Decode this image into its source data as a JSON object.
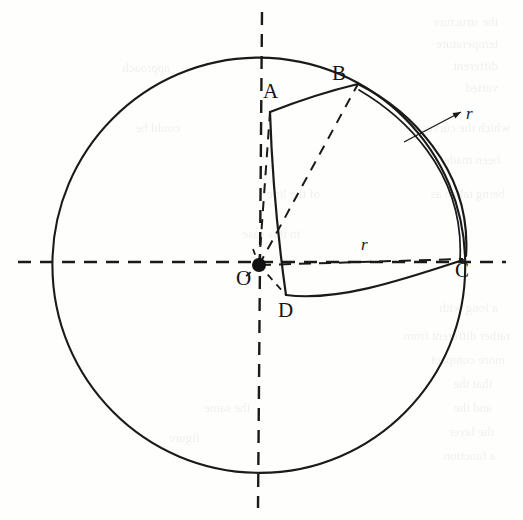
{
  "figure": {
    "background_color": "#fefefd",
    "ink_color": "#1a1a1a",
    "canvas": {
      "width": 523,
      "height": 520
    }
  },
  "labels": {
    "point_o": "O",
    "point_a": "A",
    "point_b": "B",
    "point_c": "C",
    "point_d": "D",
    "radius_inner": "r",
    "radius_outer": "r"
  },
  "geometry": {
    "sphere": {
      "center_x": 259,
      "center_y": 265,
      "radius": 207,
      "stroke": "#1a1a1a",
      "stroke_width": 2.1
    },
    "axes": {
      "horizontal": {
        "x1": 18,
        "y1": 262,
        "x2": 506,
        "y2": 262
      },
      "vertical": {
        "x1": 262,
        "y1": 12,
        "x2": 258,
        "y2": 508
      },
      "dash": "13 9",
      "stroke_width": 2.4
    },
    "points": {
      "O": {
        "x": 259,
        "y": 265
      },
      "A": {
        "x": 270,
        "y": 112
      },
      "B": {
        "x": 358,
        "y": 84
      },
      "C": {
        "x": 463,
        "y": 259
      },
      "D": {
        "x": 286,
        "y": 295
      }
    },
    "label_positions": {
      "O": {
        "x": 236,
        "y": 285
      },
      "A": {
        "x": 263,
        "y": 98
      },
      "B": {
        "x": 332,
        "y": 80
      },
      "C": {
        "x": 455,
        "y": 277
      },
      "D": {
        "x": 278,
        "y": 317
      },
      "r_inner": {
        "x": 361,
        "y": 250
      },
      "r_outer": {
        "x": 466,
        "y": 119
      }
    },
    "leader": {
      "x1": 404,
      "y1": 142,
      "x2": 461,
      "y2": 112
    },
    "solid_stroke_width": 2.2,
    "dashed_stroke_width": 2.0,
    "construction_dash": "10 8"
  },
  "ghost_text": {
    "note": "faint mirrored show-through text from reverse of scanned page",
    "lines": [
      {
        "text": "the structure",
        "x": 498,
        "y": 14,
        "size": 13
      },
      {
        "text": "temperature",
        "x": 498,
        "y": 36,
        "size": 13
      },
      {
        "text": "different",
        "x": 498,
        "y": 58,
        "size": 13
      },
      {
        "text": "varied",
        "x": 498,
        "y": 80,
        "size": 13
      },
      {
        "text": "which the curves of",
        "x": 510,
        "y": 120,
        "size": 13
      },
      {
        "text": "been made",
        "x": 500,
        "y": 152,
        "size": 13
      },
      {
        "text": "being taken as",
        "x": 505,
        "y": 186,
        "size": 13
      },
      {
        "text": "a long with",
        "x": 498,
        "y": 300,
        "size": 13
      },
      {
        "text": "rather different from",
        "x": 510,
        "y": 328,
        "size": 13
      },
      {
        "text": "more compact",
        "x": 505,
        "y": 352,
        "size": 13
      },
      {
        "text": "that the",
        "x": 492,
        "y": 376,
        "size": 13
      },
      {
        "text": "and the",
        "x": 492,
        "y": 400,
        "size": 13
      },
      {
        "text": "the layer",
        "x": 494,
        "y": 424,
        "size": 13
      },
      {
        "text": "a function",
        "x": 496,
        "y": 448,
        "size": 13
      },
      {
        "text": "of the line",
        "x": 320,
        "y": 186,
        "size": 13
      },
      {
        "text": "in this case",
        "x": 300,
        "y": 226,
        "size": 13
      },
      {
        "text": "the same",
        "x": 250,
        "y": 400,
        "size": 13
      },
      {
        "text": "figure",
        "x": 200,
        "y": 430,
        "size": 13
      },
      {
        "text": "could be",
        "x": 180,
        "y": 120,
        "size": 13
      },
      {
        "text": "approach",
        "x": 170,
        "y": 60,
        "size": 13
      }
    ]
  }
}
